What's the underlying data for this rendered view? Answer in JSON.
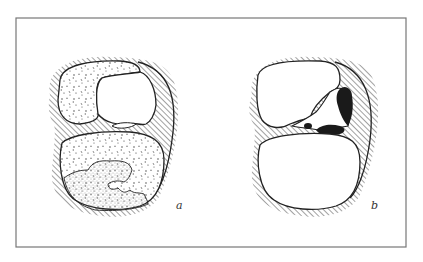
{
  "figure": {
    "panels": [
      {
        "id": "a",
        "label": "a"
      },
      {
        "id": "b",
        "label": "b"
      }
    ],
    "colors": {
      "ink": "#222222",
      "frame": "#777777",
      "background": "#ffffff",
      "stipple": "#555555"
    }
  }
}
